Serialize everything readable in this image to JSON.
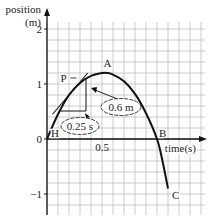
{
  "chart_data": {
    "type": "line",
    "title": "",
    "ylabel_line1": "position",
    "ylabel_line2": "(m)",
    "xlabel": "time(s)",
    "y_ticks": [
      {
        "value": 2,
        "label": "2"
      },
      {
        "value": 1,
        "label": "1"
      },
      {
        "value": 0,
        "label": "0"
      },
      {
        "value": -1,
        "label": "−1"
      }
    ],
    "x_ticks": [
      {
        "value": 0.5,
        "label": "0.5"
      }
    ],
    "xlim": [
      0,
      1.4
    ],
    "ylim": [
      -1.3,
      2.4
    ],
    "grid": true,
    "grid_step_x": 0.1,
    "grid_step_y": 0.2,
    "series": [
      {
        "name": "position",
        "x": [
          0,
          0.1,
          0.2,
          0.3,
          0.4,
          0.5,
          0.55,
          0.6,
          0.7,
          0.8,
          0.9,
          1.0,
          1.05,
          1.1
        ],
        "y": [
          0,
          0.45,
          0.8,
          1.02,
          1.15,
          1.2,
          1.2,
          1.17,
          1.05,
          0.82,
          0.47,
          0.0,
          -0.4,
          -0.9
        ]
      }
    ],
    "points": [
      {
        "label": "H",
        "x": 0.0,
        "y": 0.0
      },
      {
        "label": "P",
        "x": 0.25,
        "y": 1.0
      },
      {
        "label": "A",
        "x": 0.55,
        "y": 1.2
      },
      {
        "label": "B",
        "x": 1.0,
        "y": 0.0
      },
      {
        "label": "C",
        "x": 1.1,
        "y": -0.9
      }
    ],
    "tangent_at_P": {
      "x1": 0.05,
      "y1": 0.45,
      "x2": 0.37,
      "y2": 1.2
    },
    "triangle": {
      "run_label": "0.25 s",
      "rise_label": "0.6 m"
    },
    "annotations": [
      "0.25 s",
      "0.6 m"
    ]
  },
  "labels": {
    "H": "H",
    "P": "P",
    "A": "A",
    "B": "B",
    "C": "C",
    "run": "0.25 s",
    "rise": "0.6 m"
  }
}
